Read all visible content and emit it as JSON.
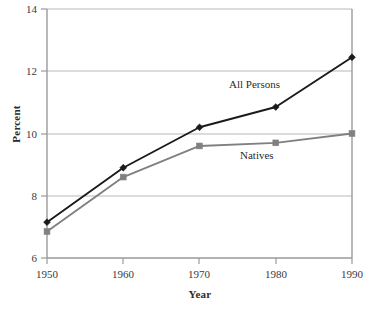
{
  "chart_data": {
    "type": "line",
    "title": "",
    "subtitle": "",
    "xlabel": "Year",
    "ylabel": "Percent",
    "x": [
      1950,
      1960,
      1970,
      1980,
      1990
    ],
    "categories": [
      "1950",
      "1960",
      "1970",
      "1980",
      "1990"
    ],
    "xlim": [
      1950,
      1990
    ],
    "ylim": [
      6,
      14
    ],
    "ytick_labels": [
      "6",
      "8",
      "10",
      "12",
      "14"
    ],
    "ytick_values": [
      6,
      8,
      10,
      12,
      14
    ],
    "xtick_labels": [
      "1950",
      "1960",
      "1970",
      "1980",
      "1990"
    ],
    "grid": "horizontal",
    "legend_position": "inline-annotations",
    "series": [
      {
        "name": "All Persons",
        "color": "#1a1a1a",
        "marker": "diamond",
        "values": [
          7.15,
          8.9,
          10.2,
          10.85,
          12.45
        ]
      },
      {
        "name": "Natives",
        "color": "#808080",
        "marker": "square",
        "values": [
          6.85,
          8.6,
          9.6,
          9.7,
          10.0
        ]
      }
    ],
    "annotations": [
      {
        "text": "All Persons",
        "x": 1977,
        "y": 11.5
      },
      {
        "text": "Natives",
        "x": 1978,
        "y": 9.1
      }
    ]
  },
  "axes": {
    "y_title": "Percent",
    "x_title": "Year",
    "y_ticks": [
      {
        "label": "14"
      },
      {
        "label": "12"
      },
      {
        "label": "10"
      },
      {
        "label": "8"
      },
      {
        "label": "6"
      }
    ],
    "x_ticks": [
      {
        "label": "1950"
      },
      {
        "label": "1960"
      },
      {
        "label": "1970"
      },
      {
        "label": "1980"
      },
      {
        "label": "1990"
      }
    ]
  },
  "annotations": {
    "all_persons": "All Persons",
    "natives": "Natives"
  },
  "colors": {
    "all_persons_line": "#1a1a1a",
    "natives_line": "#808080",
    "gridline": "#b8b8b8",
    "axis": "#9a9a9a",
    "text": "#2b2b2b",
    "background": "#ffffff"
  }
}
